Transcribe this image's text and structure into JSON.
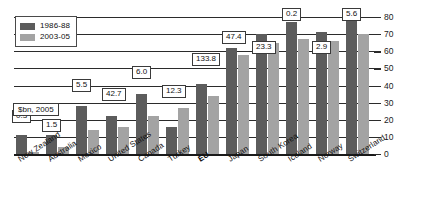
{
  "chart_data": {
    "type": "bar",
    "title": "",
    "subtitle": "",
    "xlabel": "",
    "ylabel": "",
    "unit_note": "$bn, 2005",
    "ylim": [
      0,
      80
    ],
    "ytick_labels": [
      "0",
      "10",
      "20",
      "30",
      "40",
      "50",
      "60",
      "70",
      "80"
    ],
    "ytick_values": [
      0,
      10,
      20,
      30,
      40,
      50,
      60,
      70,
      80
    ],
    "grid": true,
    "legend_position": "top-left",
    "categories": [
      "New Zealand",
      "Australia",
      "Mexico",
      "United States",
      "Canada",
      "Turkey",
      "EU",
      "Japan",
      "South Korea",
      "Iceland",
      "Norway",
      "Switzerland"
    ],
    "highlighted_categories": [
      "EU"
    ],
    "series": [
      {
        "name": "1986-88",
        "color": "#5c5c5c",
        "values": [
          11,
          11,
          28,
          22,
          35,
          16,
          41,
          62,
          70,
          77,
          71,
          78
        ]
      },
      {
        "name": "2003-05",
        "color": "#a3a3a3",
        "values": [
          1,
          4,
          14,
          16,
          22,
          27,
          34,
          58,
          65,
          67,
          66,
          70
        ]
      }
    ],
    "point_labels": [
      {
        "category": "New Zealand",
        "text": "0.3"
      },
      {
        "category": "Australia",
        "text": "1.5"
      },
      {
        "category": "Mexico",
        "text": "5.5"
      },
      {
        "category": "United States",
        "text": "42.7"
      },
      {
        "category": "Canada",
        "text": "6.0"
      },
      {
        "category": "Turkey",
        "text": "12.3"
      },
      {
        "category": "EU",
        "text": "133.8"
      },
      {
        "category": "Japan",
        "text": "47.4"
      },
      {
        "category": "South Korea",
        "text": "23.3"
      },
      {
        "category": "Iceland",
        "text": "0.2"
      },
      {
        "category": "Norway",
        "text": "2.9"
      },
      {
        "category": "Switzerland",
        "text": "5.6"
      }
    ]
  },
  "colors": {
    "series_1": "#5c5c5c",
    "series_2": "#a3a3a3",
    "axis": "#1a1a1a",
    "background": "#ffffff"
  }
}
